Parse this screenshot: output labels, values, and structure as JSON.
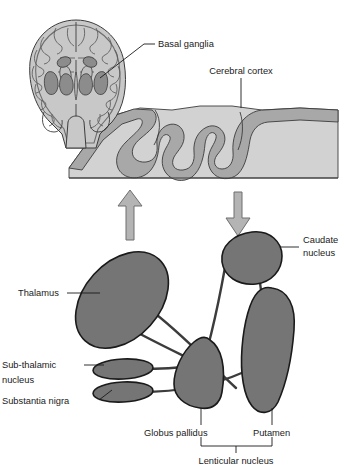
{
  "figure": {
    "width": 344,
    "height": 469
  },
  "labels": {
    "basal_ganglia": "Basal ganglia",
    "cerebral_cortex": "Cerebral cortex",
    "caudate_nucleus_line1": "Caudate",
    "caudate_nucleus_line2": "nucleus",
    "thalamus": "Thalamus",
    "subthalamic_nucleus_line1": "Sub-thalamic",
    "subthalamic_nucleus_line2": "nucleus",
    "substantia_nigra": "Substantia nigra",
    "globus_pallidus": "Globus pallidus",
    "putamen": "Putamen",
    "lenticular_nucleus": "Lenticular nucleus"
  },
  "colors": {
    "nucleus_fill": "#757575",
    "nucleus_stroke": "#1a1a1a",
    "cortex_ribbon": "#a8a8a8",
    "white_matter": "#d2d2d2",
    "brain_section_fill": "#c8c8c8",
    "brain_section_nuclei": "#8c8c8c",
    "arrow_fill": "#b4b4b4",
    "arrow_stroke": "#6e6e6e",
    "tract_line": "#3c3c3c",
    "leader_line": "#1a1a1a",
    "text": "#1a1a1a",
    "background": "#ffffff"
  },
  "icons": {
    "up_arrow": "up-arrow-icon",
    "down_arrow": "down-arrow-icon"
  },
  "structures": [
    {
      "id": "brain-coronal-section",
      "name": "Coronal brain section",
      "region": "top-left"
    },
    {
      "id": "cortex-block",
      "name": "Cerebral cortex block",
      "region": "top-right"
    },
    {
      "id": "thalamus",
      "name": "Thalamus",
      "region": "lower-left"
    },
    {
      "id": "subthalamic-nucleus",
      "name": "Sub-thalamic nucleus",
      "region": "lower-left"
    },
    {
      "id": "substantia-nigra",
      "name": "Substantia nigra",
      "region": "lower-left"
    },
    {
      "id": "globus-pallidus",
      "name": "Globus pallidus",
      "region": "lower-center"
    },
    {
      "id": "putamen",
      "name": "Putamen",
      "region": "lower-right"
    },
    {
      "id": "caudate-nucleus",
      "name": "Caudate nucleus",
      "region": "lower-right"
    }
  ]
}
